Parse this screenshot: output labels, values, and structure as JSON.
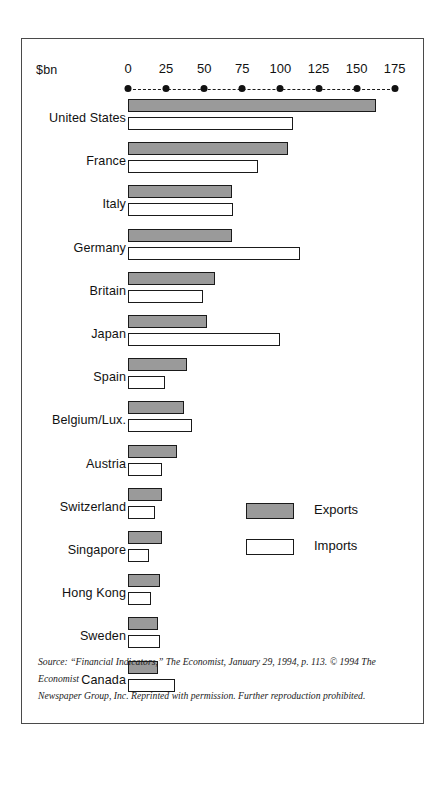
{
  "axis": {
    "unit_label": "$bn",
    "ticks": [
      0,
      25,
      50,
      75,
      100,
      125,
      150,
      175
    ],
    "tick_labels": [
      "0",
      "25",
      "50",
      "75",
      "100",
      "125",
      "150",
      "175"
    ]
  },
  "legend": {
    "exports_label": "Exports",
    "imports_label": "Imports",
    "exports_color": "#9a9a9a",
    "imports_color": "#ffffff"
  },
  "source": {
    "line1": "Source: “Financial Indicators,” The Economist, January 29, 1994, p. 113. © 1994 The Economist",
    "line2": "Newspaper Group, Inc. Reprinted with permission. Further reproduction prohibited."
  },
  "chart_data": {
    "type": "bar",
    "orientation": "horizontal",
    "title": "",
    "xlabel": "$bn",
    "ylabel": "",
    "xlim": [
      0,
      175
    ],
    "grid": false,
    "legend_position": "center-right",
    "categories": [
      "United States",
      "France",
      "Italy",
      "Germany",
      "Britain",
      "Japan",
      "Spain",
      "Belgium/Lux.",
      "Austria",
      "Switzerland",
      "Singapore",
      "Hong Kong",
      "Sweden",
      "Canada"
    ],
    "series": [
      {
        "name": "Exports",
        "color": "#9a9a9a",
        "values": [
          163,
          105,
          68,
          68,
          57,
          52,
          39,
          37,
          32,
          22,
          22,
          21,
          20,
          20
        ]
      },
      {
        "name": "Imports",
        "color": "#ffffff",
        "values": [
          108,
          85,
          69,
          113,
          49,
          100,
          24,
          42,
          22,
          18,
          14,
          15,
          21,
          31
        ]
      }
    ]
  }
}
